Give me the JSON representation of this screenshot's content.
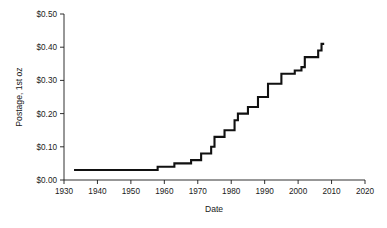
{
  "chart_data": {
    "type": "line",
    "title": "",
    "xlabel": "Date",
    "ylabel": "Postage, 1st oz",
    "xlim": [
      1930,
      2020
    ],
    "ylim": [
      0.0,
      0.5
    ],
    "grid": false,
    "legend": "none",
    "xticks": [
      1930,
      1940,
      1950,
      1960,
      1970,
      1980,
      1990,
      2000,
      2010,
      2020
    ],
    "xtick_labels": [
      "1930",
      "1940",
      "1950",
      "1960",
      "1970",
      "1980",
      "1990",
      "2000",
      "2010",
      "2020"
    ],
    "yticks": [
      0.0,
      0.1,
      0.2,
      0.3,
      0.4,
      0.5
    ],
    "ytick_labels": [
      "$0.00",
      "$0.10",
      "$0.20",
      "$0.30",
      "$0.40",
      "$0.50"
    ],
    "step_style": "post",
    "x": [
      1933,
      1958,
      1963,
      1968,
      1971,
      1974,
      1975,
      1978,
      1981,
      1981.9,
      1985,
      1988,
      1991,
      1995,
      1999,
      2001,
      2002,
      2006,
      2007,
      2008
    ],
    "values": [
      0.03,
      0.04,
      0.05,
      0.06,
      0.08,
      0.1,
      0.13,
      0.15,
      0.18,
      0.2,
      0.22,
      0.25,
      0.29,
      0.32,
      0.33,
      0.34,
      0.37,
      0.39,
      0.41,
      0.41
    ],
    "series": [
      {
        "name": "US first-class postage rate",
        "points": [
          {
            "year": 1933,
            "value": 0.03
          },
          {
            "year": 1958,
            "value": 0.04
          },
          {
            "year": 1963,
            "value": 0.05
          },
          {
            "year": 1968,
            "value": 0.06
          },
          {
            "year": 1971,
            "value": 0.08
          },
          {
            "year": 1974,
            "value": 0.1
          },
          {
            "year": 1975,
            "value": 0.13
          },
          {
            "year": 1978,
            "value": 0.15
          },
          {
            "year": 1981,
            "value": 0.18
          },
          {
            "year": 1982,
            "value": 0.2
          },
          {
            "year": 1985,
            "value": 0.22
          },
          {
            "year": 1988,
            "value": 0.25
          },
          {
            "year": 1991,
            "value": 0.29
          },
          {
            "year": 1995,
            "value": 0.32
          },
          {
            "year": 1999,
            "value": 0.33
          },
          {
            "year": 2001,
            "value": 0.34
          },
          {
            "year": 2002,
            "value": 0.37
          },
          {
            "year": 2006,
            "value": 0.39
          },
          {
            "year": 2007,
            "value": 0.41
          }
        ]
      }
    ],
    "line_color": "#111111"
  }
}
